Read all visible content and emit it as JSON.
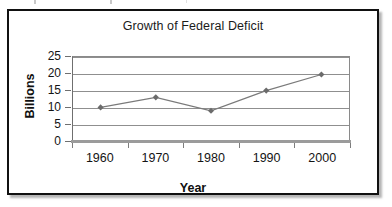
{
  "chart_data": {
    "type": "line",
    "title": "Growth of Federal Deficit",
    "xlabel": "Year",
    "ylabel": "Billions",
    "categories": [
      "1960",
      "1970",
      "1980",
      "1990",
      "2000"
    ],
    "values": [
      10,
      13,
      9,
      15,
      19.8
    ],
    "series": [
      {
        "name": "Federal Deficit",
        "values": [
          10,
          13,
          9,
          15,
          19.8
        ]
      }
    ],
    "ylim": [
      0,
      25
    ],
    "yticks": [
      "0",
      "5",
      "10",
      "15",
      "20",
      "25"
    ],
    "ytick_values": [
      0,
      5,
      10,
      15,
      20,
      25
    ],
    "grid": "horizontal",
    "legend": "none",
    "marker": "diamond",
    "line_color": "#7a7a7a",
    "marker_color": "#6b6b6b",
    "grid_color": "#8f8f8f",
    "text_color": "#141414",
    "frame_color": "#111111"
  }
}
